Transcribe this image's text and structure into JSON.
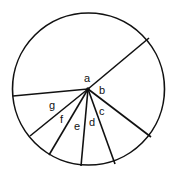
{
  "diagram": {
    "type": "circle-sectors",
    "center_label": "a",
    "sector_labels": [
      "b",
      "c",
      "d",
      "e",
      "f",
      "g"
    ],
    "stroke_color": "#111111",
    "background": "#ffffff"
  }
}
